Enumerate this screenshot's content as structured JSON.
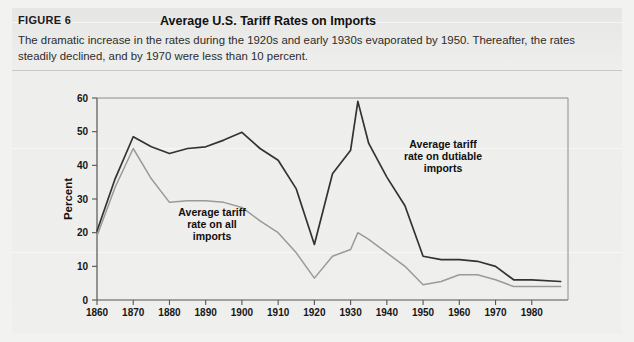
{
  "figure": {
    "label": "FIGURE 6",
    "title": "Average U.S. Tariff Rates on Imports",
    "caption": "The dramatic increase in the rates during the 1920s and early 1930s evaporated by 1950. Thereafter, the rates steadily declined, and by 1970 were less than 10 percent."
  },
  "colors": {
    "panel": "#e9e9e7",
    "dutiable_line": "#333333",
    "all_imports_line": "#9a9a9a",
    "axis": "#555555",
    "text": "#161616"
  },
  "annotations": {
    "dutiable": {
      "line1": "Average tariff",
      "line2": "rate on dutiable",
      "line3": "imports"
    },
    "all_imports": {
      "line1": "Average tariff",
      "line2": "rate on all",
      "line3": "imports"
    }
  },
  "chart_data": {
    "type": "line",
    "title": "Average U.S. Tariff Rates on Imports",
    "xlabel": "",
    "ylabel": "Percent",
    "xlim": [
      1860,
      1990
    ],
    "ylim": [
      0,
      60
    ],
    "yticks": [
      0,
      10,
      20,
      30,
      40,
      50,
      60
    ],
    "xticks": [
      1860,
      1870,
      1880,
      1890,
      1900,
      1910,
      1920,
      1930,
      1940,
      1950,
      1960,
      1970,
      1980
    ],
    "ytick_labels": [
      "0",
      "10",
      "20",
      "30",
      "40",
      "50",
      "60"
    ],
    "xtick_labels": [
      "1860",
      "1870",
      "1880",
      "1890",
      "1900",
      "1910",
      "1920",
      "1930",
      "1940",
      "1950",
      "1960",
      "1970",
      "1980"
    ],
    "grid": false,
    "legend": "annotations-inline",
    "series": [
      {
        "name": "Average tariff rate on dutiable imports",
        "color": "#333333",
        "x": [
          1860,
          1865,
          1870,
          1875,
          1880,
          1885,
          1890,
          1895,
          1900,
          1905,
          1910,
          1915,
          1920,
          1925,
          1930,
          1932,
          1935,
          1940,
          1945,
          1950,
          1955,
          1960,
          1965,
          1970,
          1975,
          1980,
          1988
        ],
        "values": [
          20.5,
          36.0,
          48.5,
          45.5,
          43.5,
          45.0,
          45.5,
          47.5,
          49.8,
          45.0,
          41.5,
          33.0,
          16.5,
          37.5,
          44.5,
          59.0,
          46.5,
          36.5,
          28.0,
          13.0,
          12.0,
          12.0,
          11.5,
          10.0,
          6.0,
          6.0,
          5.5
        ]
      },
      {
        "name": "Average tariff rate on all imports",
        "color": "#9a9a9a",
        "x": [
          1860,
          1865,
          1870,
          1875,
          1880,
          1885,
          1890,
          1895,
          1900,
          1905,
          1910,
          1915,
          1920,
          1925,
          1930,
          1932,
          1935,
          1940,
          1945,
          1950,
          1955,
          1960,
          1965,
          1970,
          1975,
          1980,
          1988
        ],
        "values": [
          19.0,
          33.5,
          45.0,
          36.0,
          29.0,
          29.5,
          29.5,
          29.0,
          27.5,
          23.5,
          20.0,
          14.0,
          6.5,
          13.0,
          15.0,
          20.0,
          18.0,
          14.0,
          10.0,
          4.5,
          5.5,
          7.5,
          7.5,
          6.0,
          4.0,
          4.0,
          4.0
        ]
      }
    ]
  },
  "plot_box": {
    "left": 97,
    "top": 98,
    "right": 568,
    "bottom": 300
  }
}
